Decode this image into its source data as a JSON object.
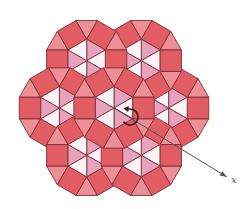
{
  "figure": {
    "center": [
      114,
      108
    ],
    "edge_length": 21.5,
    "cluster_count": 7,
    "axis": {
      "label": "x",
      "angle_deg": 31,
      "end": [
        227,
        177
      ]
    },
    "rotation_arrow": {
      "center": [
        130,
        117
      ],
      "radius": 8
    }
  },
  "colors": {
    "square": "#e25c63",
    "outer_triangle": "#ec8f96",
    "hex_pink": "#e7a2bd",
    "hex_white": "#fbf3f6",
    "edge": "#7d3036",
    "axis": "#555555",
    "arrow": "#3a1a1a"
  }
}
